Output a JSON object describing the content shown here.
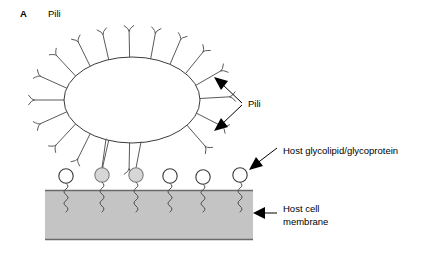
{
  "figure": {
    "panel_letter": "A",
    "panel_title": "Pili",
    "background_color": "#ffffff"
  },
  "labels": {
    "pili": "Pili",
    "glycolipid": "Host glycolipid/glycoprotein",
    "membrane_line1": "Host cell",
    "membrane_line2": "membrane"
  },
  "colors": {
    "membrane_fill": "#c4c4c4",
    "membrane_edge": "#6a6a6a",
    "cell_outline": "#3b3b3b",
    "pilus_stroke": "#5a5a5a",
    "receptor_bound_fill": "#d6d6d6",
    "receptor_open_fill": "#ffffff",
    "arrow_color": "#000000"
  },
  "bacterium": {
    "name": "bacterial-cell",
    "center_x": 132,
    "center_y": 100,
    "radius_x": 68,
    "radius_y": 43,
    "fill": "#ffffff"
  },
  "membrane": {
    "x": 45,
    "y": 190,
    "width": 208,
    "height": 50,
    "fill": "#c4c4c4"
  },
  "receptors": [
    {
      "index": 1,
      "cx": 66,
      "cy": 176,
      "bound": false
    },
    {
      "index": 2,
      "cx": 102,
      "cy": 175,
      "bound": true
    },
    {
      "index": 3,
      "cx": 136,
      "cy": 175,
      "bound": true
    },
    {
      "index": 4,
      "cx": 170,
      "cy": 176,
      "bound": false
    },
    {
      "index": 5,
      "cx": 203,
      "cy": 177,
      "bound": false
    },
    {
      "index": 6,
      "cx": 240,
      "cy": 175,
      "bound": false
    }
  ],
  "pili_free": [
    {
      "angle_deg": 268,
      "length": 26
    },
    {
      "angle_deg": 250,
      "length": 27
    },
    {
      "angle_deg": 232,
      "length": 28
    },
    {
      "angle_deg": 214,
      "length": 29
    },
    {
      "angle_deg": 196,
      "length": 29
    },
    {
      "angle_deg": 180,
      "length": 30
    },
    {
      "angle_deg": 164,
      "length": 29
    },
    {
      "angle_deg": 146,
      "length": 28
    },
    {
      "angle_deg": 128,
      "length": 27
    },
    {
      "angle_deg": 110,
      "length": 26
    },
    {
      "angle_deg": 92,
      "length": 26
    },
    {
      "angle_deg": 74,
      "length": 26
    },
    {
      "angle_deg": 56,
      "length": 27
    },
    {
      "angle_deg": 38,
      "length": 28
    },
    {
      "angle_deg": 20,
      "length": 29
    },
    {
      "angle_deg": 2,
      "length": 30
    },
    {
      "angle_deg": 342,
      "length": 29
    },
    {
      "angle_deg": 324,
      "length": 28
    }
  ],
  "pili_attached": [
    {
      "from_x": 106,
      "from_y": 139,
      "to_x": 102,
      "to_y": 168
    },
    {
      "from_x": 141,
      "from_y": 142,
      "to_x": 136,
      "to_y": 168
    }
  ],
  "callouts": [
    {
      "name": "pili-callout",
      "text": "Pili",
      "text_x": 248,
      "text_y": 103,
      "arrow_count": 2
    },
    {
      "name": "glycolipid-callout",
      "text": "Host glycolipid/glycoprotein",
      "text_x": 283,
      "text_y": 155,
      "arrow_count": 1
    },
    {
      "name": "membrane-callout",
      "text": "Host cell membrane",
      "text_x": 283,
      "text_y": 216,
      "arrow_count": 1
    }
  ]
}
